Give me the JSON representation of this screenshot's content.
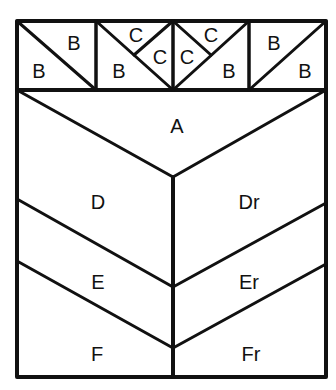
{
  "diagram": {
    "type": "quilt-block layout",
    "line_color": "#111111",
    "background": "#ffffff",
    "top_row": {
      "blocks": [
        {
          "pieces": [
            {
              "label": "B",
              "pos": "top-right"
            },
            {
              "label": "B",
              "pos": "bottom-left"
            }
          ]
        },
        {
          "pieces": [
            {
              "label": "C",
              "pos": "top"
            },
            {
              "label": "C",
              "pos": "right"
            },
            {
              "label": "B",
              "pos": "bottom-left"
            }
          ]
        },
        {
          "pieces": [
            {
              "label": "C",
              "pos": "left"
            },
            {
              "label": "C",
              "pos": "top"
            },
            {
              "label": "B",
              "pos": "bottom-right"
            }
          ]
        },
        {
          "pieces": [
            {
              "label": "B",
              "pos": "top-left"
            },
            {
              "label": "B",
              "pos": "bottom-right"
            }
          ]
        }
      ]
    },
    "regions": {
      "A": "A",
      "D": "D",
      "Dr": "Dr",
      "E": "E",
      "Er": "Er",
      "F": "F",
      "Fr": "Fr"
    }
  }
}
